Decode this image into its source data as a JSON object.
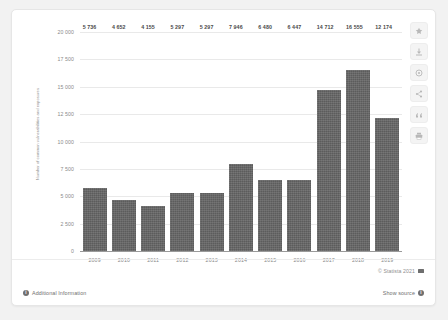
{
  "chart_data": {
    "type": "bar",
    "title": "",
    "xlabel": "",
    "ylabel": "Number of common vulnerabilities and exposures",
    "categories": [
      "2009",
      "2010",
      "2011",
      "2012",
      "2013",
      "2014",
      "2015",
      "2016",
      "2017",
      "2018",
      "2019"
    ],
    "values": [
      5736,
      4652,
      4155,
      5297,
      5297,
      7946,
      6480,
      6447,
      14712,
      16555,
      12174
    ],
    "value_labels": [
      "5 736",
      "4 652",
      "4 155",
      "5 297",
      "5 297",
      "7 946",
      "6 480",
      "6 447",
      "14 712",
      "16 555",
      "12 174"
    ],
    "ylim": [
      0,
      20000
    ],
    "ytick_values": [
      20000,
      17500,
      15000,
      12500,
      10000,
      7500,
      5000,
      2500,
      0
    ],
    "ytick_labels": [
      "20 000",
      "17 500",
      "15 000",
      "12 500",
      "10 000",
      "7 500",
      "5 000",
      "2 500",
      "0"
    ],
    "grid": true,
    "legend": false,
    "bar_color": "#5c5c5c"
  },
  "toolbar": {
    "buttons": [
      {
        "name": "favorite-icon",
        "label": "Favorite"
      },
      {
        "name": "download-icon",
        "label": "Download"
      },
      {
        "name": "settings-icon",
        "label": "Settings"
      },
      {
        "name": "share-icon",
        "label": "Share"
      },
      {
        "name": "citation-icon",
        "label": "Cite"
      },
      {
        "name": "print-icon",
        "label": "Print"
      }
    ]
  },
  "footer": {
    "copyright": "© Statista 2021",
    "additional_information": "Additional Information",
    "show_source": "Show source",
    "info_glyph": "i"
  }
}
